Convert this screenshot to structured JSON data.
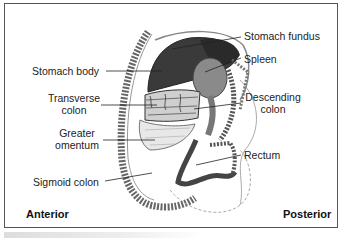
{
  "figure": {
    "labels": {
      "stomach_fundus": "Stomach fundus",
      "spleen": "Spleen",
      "stomach_body": "Stomach body",
      "transverse_colon_1": "Transverse",
      "transverse_colon_2": "colon",
      "descending_colon_1": "Descending",
      "descending_colon_2": "colon",
      "greater_omentum_1": "Greater",
      "greater_omentum_2": "omentum",
      "rectum": "Rectum",
      "sigmoid_colon": "Sigmoid colon"
    },
    "orientation": {
      "anterior": "Anterior",
      "posterior": "Posterior"
    }
  }
}
